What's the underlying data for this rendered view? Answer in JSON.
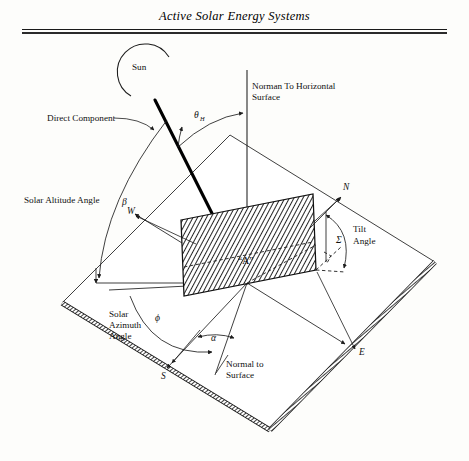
{
  "page": {
    "running_head": "Active Solar Energy Systems",
    "background_color": "#fdfdfb",
    "ink_color": "#111111"
  },
  "figure": {
    "name": "solar-collector-angle-geometry",
    "labels": {
      "sun": "Sun",
      "direct_component": "Direct Component",
      "normal_to_horizontal_line1": "Norman To Horizontal",
      "normal_to_horizontal_line2": "Surface",
      "solar_altitude_angle": "Solar Altitude Angle",
      "solar_azimuth_line1": "Solar",
      "solar_azimuth_line2": "Azimuth",
      "solar_azimuth_line3": "Angle",
      "tilt_angle_line1": "Tilt",
      "tilt_angle_line2": "Angle",
      "normal_to_surface_line1": "Normal to",
      "normal_to_surface_line2": "Surface",
      "collector_area": "“A”"
    },
    "symbols": {
      "incidence_angle_base": "θ",
      "incidence_angle_subscript": "H",
      "altitude_angle": "β",
      "azimuth_angle": "ϕ",
      "surface_azimuth_angle": "α",
      "tilt_angle": "Σ"
    },
    "compass_points": {
      "north": "N",
      "south": "S",
      "east": "E",
      "west": "W"
    }
  }
}
